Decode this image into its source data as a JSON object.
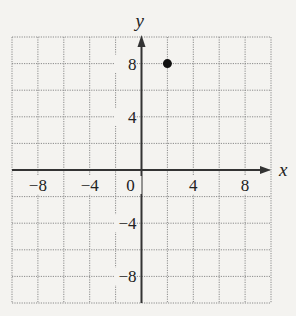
{
  "chart_data": {
    "type": "scatter",
    "title": "",
    "xlabel": "x",
    "ylabel": "y",
    "xlim": [
      -10,
      10
    ],
    "ylim": [
      -10,
      10
    ],
    "grid": true,
    "grid_step": 2,
    "x_ticks": [
      -8,
      -4,
      0,
      4,
      8
    ],
    "y_ticks": [
      8,
      4,
      -4,
      -8
    ],
    "x_tick_labels": [
      "−8",
      "−4",
      "0",
      "4",
      "8"
    ],
    "y_tick_labels": [
      "8",
      "4",
      "−4",
      "−8"
    ],
    "points": [
      {
        "x": 2,
        "y": 8
      }
    ],
    "colors": {
      "axis": "#333333",
      "grid": "#8a8a8a",
      "point": "#111111",
      "background": "#f4f3f0"
    }
  }
}
